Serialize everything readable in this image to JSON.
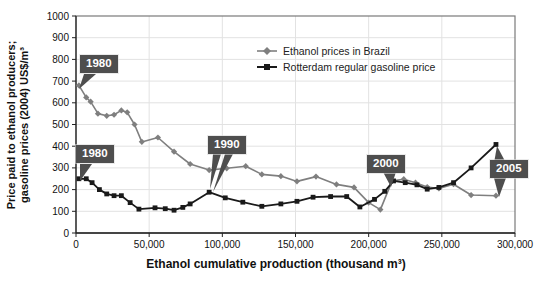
{
  "figure": {
    "y_axis_title_line1": "Price paid to ethanol producers;",
    "y_axis_title_line2": "gasoline prices (2004) US$/m³",
    "x_axis_title": "Ethanol cumulative production (thousand m³)"
  },
  "chart_data": {
    "type": "line",
    "title": "",
    "xlabel": "Ethanol cumulative production (thousand m³)",
    "ylabel": "Price paid to ethanol producers; gasoline prices (2004) US$/m³",
    "xlim": [
      0,
      300000
    ],
    "ylim": [
      0,
      1000
    ],
    "grid": true,
    "legend_position": "inside upper center-right",
    "colors": {
      "grid": "#e2e2e2",
      "frame": "#7a7a7a",
      "axis": "#222222",
      "tick_text": "#111111",
      "callout_bg": "#4e4e4e",
      "callout_text": "#ffffff"
    },
    "x_ticks": [
      {
        "v": 0,
        "label": "0"
      },
      {
        "v": 50000,
        "label": "50,000"
      },
      {
        "v": 100000,
        "label": "100,000"
      },
      {
        "v": 150000,
        "label": "150,000"
      },
      {
        "v": 200000,
        "label": "200,000"
      },
      {
        "v": 250000,
        "label": "250,000"
      },
      {
        "v": 300000,
        "label": "300,000"
      }
    ],
    "y_ticks": [
      {
        "v": 0,
        "label": "0"
      },
      {
        "v": 100,
        "label": "100"
      },
      {
        "v": 200,
        "label": "200"
      },
      {
        "v": 300,
        "label": "300"
      },
      {
        "v": 400,
        "label": "400"
      },
      {
        "v": 500,
        "label": "500"
      },
      {
        "v": 600,
        "label": "600"
      },
      {
        "v": 700,
        "label": "700"
      },
      {
        "v": 800,
        "label": "800"
      },
      {
        "v": 900,
        "label": "900"
      },
      {
        "v": 1000,
        "label": "1000"
      }
    ],
    "series": [
      {
        "name": "Ethanol prices in Brazil",
        "color": "#7f7f7f",
        "marker": "diamond",
        "line_width": 1.6,
        "points": [
          [
            2000,
            680
          ],
          [
            7000,
            625
          ],
          [
            10000,
            605
          ],
          [
            15000,
            550
          ],
          [
            21000,
            540
          ],
          [
            26000,
            545
          ],
          [
            31000,
            565
          ],
          [
            35000,
            556
          ],
          [
            40000,
            500
          ],
          [
            45000,
            420
          ],
          [
            56000,
            440
          ],
          [
            67000,
            375
          ],
          [
            78000,
            318
          ],
          [
            91000,
            290
          ],
          [
            103000,
            298
          ],
          [
            116000,
            308
          ],
          [
            127000,
            270
          ],
          [
            140000,
            262
          ],
          [
            151000,
            238
          ],
          [
            164000,
            260
          ],
          [
            178000,
            224
          ],
          [
            190000,
            210
          ],
          [
            200000,
            140
          ],
          [
            208000,
            108
          ],
          [
            216000,
            240
          ],
          [
            224000,
            248
          ],
          [
            232000,
            232
          ],
          [
            240000,
            212
          ],
          [
            248000,
            205
          ],
          [
            258000,
            225
          ],
          [
            270000,
            175
          ],
          [
            287000,
            172
          ]
        ]
      },
      {
        "name": "Rotterdam regular gasoline price",
        "color": "#1a1a1a",
        "marker": "square",
        "line_width": 1.8,
        "points": [
          [
            2000,
            250
          ],
          [
            7000,
            250
          ],
          [
            11000,
            232
          ],
          [
            16000,
            200
          ],
          [
            21000,
            180
          ],
          [
            26000,
            172
          ],
          [
            31000,
            172
          ],
          [
            37000,
            140
          ],
          [
            43000,
            110
          ],
          [
            54000,
            116
          ],
          [
            61000,
            112
          ],
          [
            67000,
            105
          ],
          [
            73000,
            118
          ],
          [
            78000,
            134
          ],
          [
            91000,
            188
          ],
          [
            102000,
            162
          ],
          [
            114000,
            142
          ],
          [
            127000,
            123
          ],
          [
            140000,
            134
          ],
          [
            151000,
            146
          ],
          [
            162000,
            165
          ],
          [
            174000,
            168
          ],
          [
            185000,
            168
          ],
          [
            194000,
            120
          ],
          [
            204000,
            155
          ],
          [
            211000,
            192
          ],
          [
            217000,
            240
          ],
          [
            225000,
            232
          ],
          [
            233000,
            222
          ],
          [
            240000,
            202
          ],
          [
            248000,
            210
          ],
          [
            258000,
            232
          ],
          [
            270000,
            300
          ],
          [
            287000,
            408
          ]
        ]
      }
    ],
    "annotations": [
      {
        "label": "1980",
        "series": "Ethanol prices in Brazil",
        "target_x": 2000,
        "target_y": 680
      },
      {
        "label": "1980",
        "series": "Rotterdam regular gasoline price",
        "target_x": 2000,
        "target_y": 250
      },
      {
        "label": "1990",
        "series": "Rotterdam regular gasoline price",
        "target_x": 91000,
        "target_y": 188
      },
      {
        "label": "2000",
        "series": "both",
        "target_x": 215000,
        "target_y": 225
      },
      {
        "label": "2005",
        "series": "both",
        "target_x": 287000,
        "target_y": 408
      }
    ]
  }
}
